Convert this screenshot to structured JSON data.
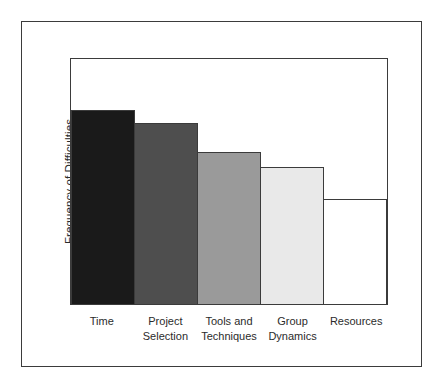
{
  "chart_data": {
    "type": "bar",
    "title": "",
    "subtitle": "",
    "xlabel": "",
    "ylabel": "Frequency of Difficulties",
    "categories": [
      "Time",
      "Project\nSelection",
      "Tools and\nTechniques",
      "Group\nDynamics",
      "Resources"
    ],
    "values": [
      79,
      74,
      62,
      56,
      43
    ],
    "value_unit": "percent-of-plot-height",
    "ylim": [
      0,
      100
    ],
    "xlim": null,
    "grid": false,
    "legend": null,
    "legend_position": "none",
    "tick_labels_y": [],
    "tick_labels_x": [
      "Time",
      "Project Selection",
      "Tools and Techniques",
      "Group Dynamics",
      "Resources"
    ],
    "bars_contiguous": true,
    "bar_colors": [
      "#1a1a1a",
      "#4e4e4e",
      "#9a9a9a",
      "#e9e9e9",
      "#ffffff"
    ],
    "bar_outline_color": "#3b3b3b",
    "annotations": []
  },
  "figure": {
    "outer_border_color": "#3b3b3b",
    "plot_frame_color": "#3b3b3b",
    "background": "#ffffff",
    "text_color": "#2b2b2b"
  },
  "axis": {
    "y_title": "Frequency of Difficulties"
  },
  "bars": [
    {
      "label": "Time",
      "label_display": "Time",
      "value": 79,
      "color": "#1a1a1a"
    },
    {
      "label": "Project Selection",
      "label_display": "Project\nSelection",
      "value": 74,
      "color": "#4e4e4e"
    },
    {
      "label": "Tools and Techniques",
      "label_display": "Tools and\nTechniques",
      "value": 62,
      "color": "#9a9a9a"
    },
    {
      "label": "Group Dynamics",
      "label_display": "Group\nDynamics",
      "value": 56,
      "color": "#e9e9e9"
    },
    {
      "label": "Resources",
      "label_display": "Resources",
      "value": 43,
      "color": "#ffffff"
    }
  ]
}
